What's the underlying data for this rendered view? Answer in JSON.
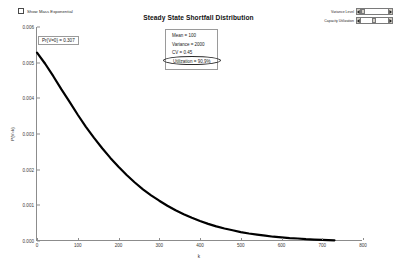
{
  "toolbar": {
    "checkbox_label": "Show Mass Exponential",
    "checkbox_checked": false,
    "checkbox_icon": "checkbox-unchecked-icon"
  },
  "spinners": [
    {
      "label": "Variance Level",
      "value": "",
      "dec_icon": "spinner-left-arrow-icon",
      "inc_icon": "spinner-right-arrow-icon"
    },
    {
      "label": "Capacity Utilization",
      "value": "",
      "dec_icon": "spinner-left-arrow-icon",
      "inc_icon": "spinner-right-arrow-icon"
    }
  ],
  "annotations": {
    "pr_zero": "Pr{V=0} = 0.307",
    "stats": {
      "mean": "Mean = 100",
      "variance": "Variance = 2000",
      "cv": "CV = 0.45",
      "utilization": "Utilization = 90.9%"
    }
  },
  "colors": {
    "curve": "#000000",
    "axis": "#8c8c8c",
    "text": "#1a1a1a",
    "control_face": "#d4d0c8"
  },
  "chart_data": {
    "type": "line",
    "title": "Steady State Shortfall Distribution",
    "xlabel": "k",
    "ylabel": "P{V=k}",
    "xlim": [
      0,
      800
    ],
    "ylim": [
      0,
      0.006
    ],
    "grid": false,
    "legend": null,
    "xticks": [
      0,
      100,
      200,
      300,
      400,
      500,
      600,
      700,
      800
    ],
    "xtick_labels": [
      "0",
      "100",
      "200",
      "300",
      "400",
      "500",
      "600",
      "700",
      "800"
    ],
    "yticks": [
      0.0,
      0.001,
      0.002,
      0.003,
      0.004,
      0.005,
      0.006
    ],
    "ytick_labels": [
      "0.000",
      "0.001",
      "0.002",
      "0.003",
      "0.004",
      "0.005",
      "0.006"
    ],
    "series": [
      {
        "name": "P{V=k}",
        "x": [
          0,
          20,
          40,
          60,
          80,
          100,
          120,
          140,
          160,
          180,
          200,
          220,
          240,
          260,
          280,
          300,
          320,
          340,
          360,
          380,
          400,
          420,
          440,
          460,
          480,
          500,
          520,
          540,
          560,
          580,
          600,
          620,
          640,
          660,
          680,
          700,
          730
        ],
        "values": [
          0.00528,
          0.00497,
          0.00462,
          0.00425,
          0.0039,
          0.00354,
          0.0032,
          0.00289,
          0.0026,
          0.00233,
          0.00208,
          0.00185,
          0.00164,
          0.00145,
          0.00128,
          0.00113,
          0.00099,
          0.00086,
          0.00075,
          0.00065,
          0.00056,
          0.00048,
          0.00041,
          0.00035,
          0.0003,
          0.00025,
          0.00021,
          0.00018,
          0.00015,
          0.00012,
          0.0001,
          8e-05,
          7e-05,
          5e-05,
          4e-05,
          3e-05,
          2e-05
        ]
      }
    ],
    "annotation_labels": [
      "Pr{V=0} = 0.307",
      "Mean = 100",
      "Variance = 2000",
      "CV = 0.45",
      "Utilization = 90.9%"
    ]
  }
}
